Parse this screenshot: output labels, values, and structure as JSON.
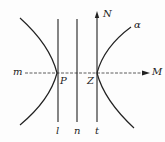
{
  "diagram": {
    "labels": {
      "m": "m",
      "M": "M",
      "N": "N",
      "alpha": "α",
      "P": "P",
      "Z": "Z",
      "l": "l",
      "n": "n",
      "t": "t"
    },
    "colors": {
      "ink": "#222222",
      "background": "#fdfdfd"
    }
  }
}
